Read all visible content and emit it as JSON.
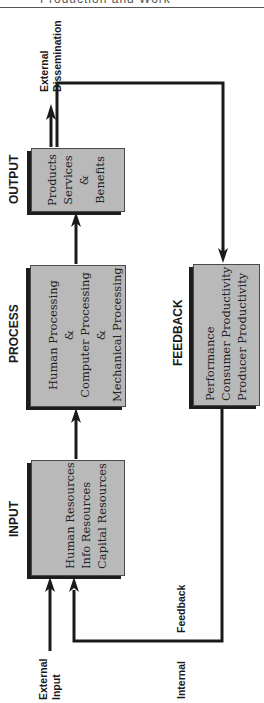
{
  "header": {
    "text": "Production and Work"
  },
  "stages": {
    "output": {
      "title": "OUTPUT",
      "lines": [
        "Products",
        "Services",
        "&",
        "Benefits"
      ]
    },
    "process": {
      "title": "PROCESS",
      "lines": [
        "Human Processing",
        "&",
        "Computer Processing",
        "&",
        "Mechanical Processing"
      ]
    },
    "input": {
      "title": "INPUT",
      "lines": [
        "Human Resources",
        "Info Resources",
        "Capital Resources"
      ]
    },
    "feedback": {
      "title": "FEEDBACK",
      "lines": [
        "Performance",
        "Consumer Productivity",
        "Producer Productivity"
      ]
    }
  },
  "annotations": {
    "external_dissemination": [
      "External",
      "Dissemination"
    ],
    "external_input": [
      "External",
      "Input"
    ],
    "internal": "Internal",
    "feedback": "Feedback"
  },
  "colors": {
    "box_fill": "#b9b9b9",
    "box_shadow": "#1d1d1d",
    "line": "#1a1a1a"
  }
}
